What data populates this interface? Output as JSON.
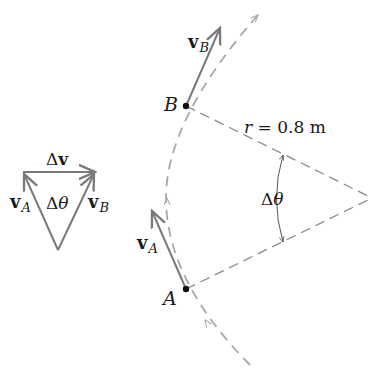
{
  "diagram": {
    "type": "uniform circular motion velocity diagram",
    "colors": {
      "vector": "#7a7a7a",
      "dashed": "#a8a8a8",
      "point": "#111111",
      "text": "#1a1a1a"
    },
    "points": {
      "A": {
        "label": "A",
        "x": 186,
        "y": 289
      },
      "B": {
        "label": "B",
        "x": 186,
        "y": 106
      },
      "center": {
        "x": 372,
        "y": 198
      }
    },
    "vectors": {
      "vA": {
        "bold": "v",
        "sub": "A"
      },
      "vB": {
        "bold": "v",
        "sub": "B"
      }
    },
    "radius_label": "r = 0.8 m",
    "radius_label_var": "r",
    "radius_label_rest": " = 0.8 m",
    "angle_label": {
      "delta": "Δ",
      "theta": "θ"
    },
    "triangle": {
      "top_label_delta": "Δ",
      "top_label_v": "v",
      "left_label": {
        "bold": "v",
        "sub": "A"
      },
      "right_label": {
        "bold": "v",
        "sub": "B"
      },
      "inner_label": {
        "delta": "Δ",
        "theta": "θ"
      }
    }
  }
}
